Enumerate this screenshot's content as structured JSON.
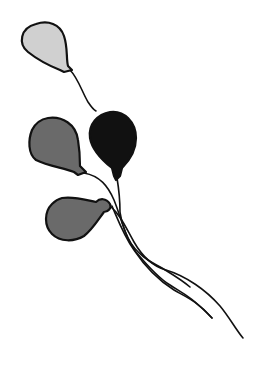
{
  "illustration": {
    "subject": "Bunch of balloons with strings",
    "balloons": [
      {
        "name": "top-light-balloon",
        "color": "#d0d0d0"
      },
      {
        "name": "left-gray-balloon",
        "color": "#6a6a6a"
      },
      {
        "name": "right-black-balloon",
        "color": "#111111"
      },
      {
        "name": "bottom-gray-balloon",
        "color": "#6a6a6a"
      }
    ],
    "outline_color": "#111111",
    "background": "#ffffff"
  }
}
